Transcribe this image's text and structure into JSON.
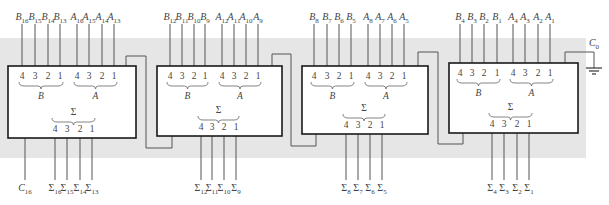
{
  "colors": {
    "background": "#ffffff",
    "band": "#e6e6e6",
    "block_fill": "#ffffff",
    "block_stroke": "#1a1a1a",
    "wire": "#555555",
    "text": "#444444"
  },
  "pin_numbers": [
    "4",
    "3",
    "2",
    "1"
  ],
  "group_labels": {
    "b": "B",
    "a": "A",
    "sum": "Σ"
  },
  "cin_label": {
    "main": "C",
    "sub": "in"
  },
  "cout_label": {
    "main": "C",
    "sub": "out"
  },
  "blocks": [
    {
      "id": "adder-bits-16-13",
      "b_inputs": [
        {
          "m": "B",
          "s": "16"
        },
        {
          "m": "B",
          "s": "15"
        },
        {
          "m": "B",
          "s": "14"
        },
        {
          "m": "B",
          "s": "13"
        }
      ],
      "a_inputs": [
        {
          "m": "A",
          "s": "16"
        },
        {
          "m": "A",
          "s": "15"
        },
        {
          "m": "A",
          "s": "14"
        },
        {
          "m": "A",
          "s": "13"
        }
      ],
      "sum_outputs": [
        {
          "m": "Σ",
          "s": "16"
        },
        {
          "m": "Σ",
          "s": "15"
        },
        {
          "m": "Σ",
          "s": "14"
        },
        {
          "m": "Σ",
          "s": "13"
        }
      ],
      "carry_out": {
        "m": "C",
        "s": "16"
      }
    },
    {
      "id": "adder-bits-12-9",
      "b_inputs": [
        {
          "m": "B",
          "s": "12"
        },
        {
          "m": "B",
          "s": "11"
        },
        {
          "m": "B",
          "s": "10"
        },
        {
          "m": "B",
          "s": "9"
        }
      ],
      "a_inputs": [
        {
          "m": "A",
          "s": "12"
        },
        {
          "m": "A",
          "s": "11"
        },
        {
          "m": "A",
          "s": "10"
        },
        {
          "m": "A",
          "s": "9"
        }
      ],
      "sum_outputs": [
        {
          "m": "Σ",
          "s": "12"
        },
        {
          "m": "Σ",
          "s": "11"
        },
        {
          "m": "Σ",
          "s": "10"
        },
        {
          "m": "Σ",
          "s": "9"
        }
      ]
    },
    {
      "id": "adder-bits-8-5",
      "b_inputs": [
        {
          "m": "B",
          "s": "8"
        },
        {
          "m": "B",
          "s": "7"
        },
        {
          "m": "B",
          "s": "6"
        },
        {
          "m": "B",
          "s": "5"
        }
      ],
      "a_inputs": [
        {
          "m": "A",
          "s": "8"
        },
        {
          "m": "A",
          "s": "7"
        },
        {
          "m": "A",
          "s": "6"
        },
        {
          "m": "A",
          "s": "5"
        }
      ],
      "sum_outputs": [
        {
          "m": "Σ",
          "s": "8"
        },
        {
          "m": "Σ",
          "s": "7"
        },
        {
          "m": "Σ",
          "s": "6"
        },
        {
          "m": "Σ",
          "s": "5"
        }
      ]
    },
    {
      "id": "adder-bits-4-1",
      "b_inputs": [
        {
          "m": "B",
          "s": "4"
        },
        {
          "m": "B",
          "s": "3"
        },
        {
          "m": "B",
          "s": "2"
        },
        {
          "m": "B",
          "s": "1"
        }
      ],
      "a_inputs": [
        {
          "m": "A",
          "s": "4"
        },
        {
          "m": "A",
          "s": "3"
        },
        {
          "m": "A",
          "s": "2"
        },
        {
          "m": "A",
          "s": "1"
        }
      ],
      "sum_outputs": [
        {
          "m": "Σ",
          "s": "4"
        },
        {
          "m": "Σ",
          "s": "3"
        },
        {
          "m": "Σ",
          "s": "2"
        },
        {
          "m": "Σ",
          "s": "1"
        }
      ],
      "carry_in": {
        "m": "C",
        "s": "0"
      }
    }
  ],
  "ground_symbol": "ground-icon"
}
